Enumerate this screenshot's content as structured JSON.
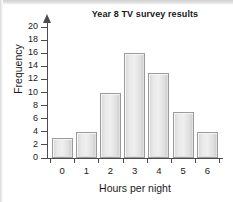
{
  "chart_data": {
    "type": "bar",
    "title": "Year 8 TV survey results",
    "xlabel": "Hours per night",
    "ylabel": "Frequency",
    "categories": [
      "0",
      "1",
      "2",
      "3",
      "4",
      "5",
      "6"
    ],
    "values": [
      3,
      4,
      10,
      16,
      13,
      7,
      4
    ],
    "ylim": [
      0,
      20
    ],
    "ytick_step": 2,
    "yticks": [
      0,
      2,
      4,
      6,
      8,
      10,
      12,
      14,
      16,
      18,
      20
    ],
    "ytick_labels": [
      "0",
      "2",
      "4",
      "6",
      "8",
      "10",
      "12",
      "14",
      "16",
      "18",
      "20"
    ],
    "xlim_categories": 7,
    "grid": false,
    "legend": null,
    "bar_fill_color": "#e9e9e9",
    "bar_edge_color": "#9a9a9a",
    "axis_color": "#4c4c4c",
    "text_color": "#1a1a1a",
    "background_color": "#ffffff",
    "y_axis_has_arrow": true
  }
}
